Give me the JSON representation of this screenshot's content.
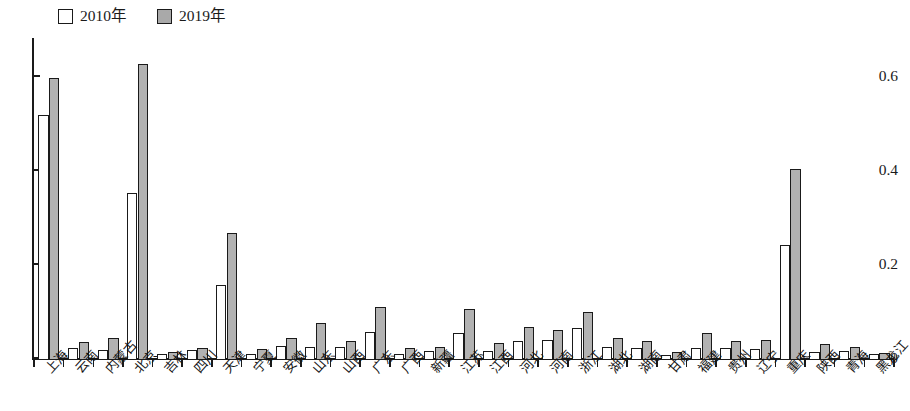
{
  "chart_data": {
    "type": "bar",
    "title": "",
    "subtitle": "",
    "xlabel": "",
    "ylabel": "",
    "ylim": [
      0,
      0.68
    ],
    "yticks": [
      0,
      0.2,
      0.4,
      0.6
    ],
    "ytick_labels": [
      "0",
      "0.2",
      "0.4",
      "0.6"
    ],
    "grid": false,
    "legend_position": "top-left",
    "categories": [
      "上海",
      "云南",
      "内蒙古",
      "北京",
      "吉林",
      "四川",
      "天津",
      "宁夏",
      "安徽",
      "山东",
      "山西",
      "广东",
      "广西",
      "新疆",
      "江苏",
      "江西",
      "河北",
      "河南",
      "浙江",
      "湖北",
      "湖南",
      "甘肃",
      "福建",
      "贵州",
      "辽宁",
      "重庆",
      "陕西",
      "青海",
      "黑龙江"
    ],
    "series": [
      {
        "name": "2010年",
        "color": "#ffffff",
        "values": [
          0.52,
          0.025,
          0.022,
          0.355,
          0.012,
          0.022,
          0.16,
          0.012,
          0.03,
          0.028,
          0.028,
          0.06,
          0.013,
          0.02,
          0.058,
          0.02,
          0.04,
          0.042,
          0.068,
          0.028,
          0.025,
          0.01,
          0.026,
          0.026,
          0.024,
          0.245,
          0.018,
          0.02,
          0.012
        ]
      },
      {
        "name": "2019年",
        "color": "#b2b2b2",
        "values": [
          0.6,
          0.038,
          0.046,
          0.63,
          0.018,
          0.026,
          0.27,
          0.024,
          0.046,
          0.078,
          0.04,
          0.113,
          0.026,
          0.028,
          0.108,
          0.036,
          0.07,
          0.064,
          0.102,
          0.046,
          0.04,
          0.016,
          0.057,
          0.04,
          0.042,
          0.405,
          0.034,
          0.028,
          0.014
        ]
      }
    ]
  },
  "legend": {
    "entries": [
      {
        "label": "2010年",
        "swatch": "white"
      },
      {
        "label": "2019年",
        "swatch": "gray"
      }
    ]
  }
}
